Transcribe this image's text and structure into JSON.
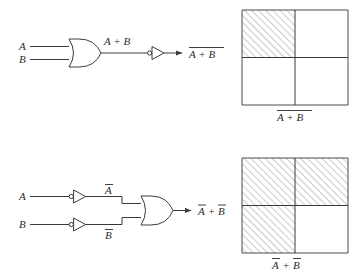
{
  "figure": {
    "line_color": "#3a3a3a",
    "box_color": "#4a4a4a",
    "hatch_color": "#8a8a8a",
    "background": "#ffffff"
  },
  "circuit_top": {
    "name": "NOR realization",
    "input_a": "A",
    "input_b": "B",
    "gate_type": "or-gate",
    "intermediate_label": "A + B",
    "inverter_type": "not-gate",
    "output_label_main": "A + B",
    "output_overbar": "full",
    "output_reading": "NOT (A OR B)"
  },
  "circuit_bottom": {
    "name": "De Morgan equivalent",
    "input_a": "A",
    "input_b": "B",
    "inverted_a": "A",
    "inverted_b": "B",
    "gate_type": "or-gate",
    "inverter_type": "not-gate",
    "output_left": "A",
    "output_plus": "+",
    "output_right": "B",
    "output_reading": "NOT A OR NOT B"
  },
  "diagram_top": {
    "caption_expression": "A + B",
    "caption_overbar": "full",
    "quadrants": [
      {
        "position": "top-left",
        "shaded": true
      },
      {
        "position": "top-right",
        "shaded": false
      },
      {
        "position": "bottom-left",
        "shaded": false
      },
      {
        "position": "bottom-right",
        "shaded": false
      }
    ],
    "shaded_count": 1
  },
  "diagram_bottom": {
    "caption_left": "A",
    "caption_plus": "+",
    "caption_right": "B",
    "caption_overbar": "separate",
    "quadrants": [
      {
        "position": "top-left",
        "shaded": true
      },
      {
        "position": "top-right",
        "shaded": true
      },
      {
        "position": "bottom-left",
        "shaded": true
      },
      {
        "position": "bottom-right",
        "shaded": false
      }
    ],
    "shaded_count": 3
  }
}
